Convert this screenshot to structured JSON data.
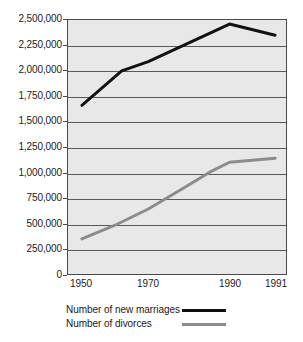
{
  "chart_data": {
    "type": "line",
    "title": "",
    "xlabel": "",
    "ylabel": "",
    "x": [
      "1950",
      "1970",
      "1990",
      "1991"
    ],
    "x_positions_px": [
      81,
      148,
      230,
      276
    ],
    "ylim": [
      0,
      2500000
    ],
    "y_ticks": [
      0,
      250000,
      500000,
      750000,
      1000000,
      1250000,
      1500000,
      1750000,
      2000000,
      2250000,
      2500000
    ],
    "y_tick_labels": [
      "0",
      "250,000",
      "500,000",
      "750,000",
      "1,000,000",
      "1,250,000",
      "1,500,000",
      "1,750,000",
      "2,000,000",
      "2,250,000",
      "2,500,000"
    ],
    "grid": true,
    "grid_orientation": "horizontal",
    "legend_position": "bottom-left",
    "series": [
      {
        "name": "Number of new marriages",
        "color": "#111111",
        "width": 3,
        "values": [
          1660000,
          2090000,
          2460000,
          2350000
        ],
        "vertices": [
          {
            "x": "1950",
            "y": 1660000
          },
          {
            "x": "1962",
            "y": 2000000
          },
          {
            "x": "1970",
            "y": 2090000
          },
          {
            "x": "1990",
            "y": 2460000
          },
          {
            "x": "1991",
            "y": 2350000
          }
        ]
      },
      {
        "name": "Number of divorces",
        "color": "#8c8c8c",
        "width": 3,
        "values": [
          345000,
          640000,
          1100000,
          1140000
        ],
        "vertices": [
          {
            "x": "1950",
            "y": 345000
          },
          {
            "x": "1960",
            "y": 480000
          },
          {
            "x": "1970",
            "y": 640000
          },
          {
            "x": "1978",
            "y": 830000
          },
          {
            "x": "1985",
            "y": 1000000
          },
          {
            "x": "1990",
            "y": 1100000
          },
          {
            "x": "1991",
            "y": 1140000
          }
        ]
      }
    ]
  },
  "axes": {
    "y_tick_labels": [
      "2,500,000",
      "2,250,000",
      "2,000,000",
      "1,750,000",
      "1,500,000",
      "1,250,000",
      "1,000,000",
      "750,000",
      "500,000",
      "250,000",
      "0"
    ],
    "x_tick_labels": [
      "1950",
      "1970",
      "1990",
      "1991"
    ]
  },
  "legend": {
    "items": [
      {
        "label": "Number of new marriages",
        "color": "#111111"
      },
      {
        "label": "Number of divorces",
        "color": "#8c8c8c"
      }
    ]
  },
  "title_remnant": "",
  "colors": {
    "plot_background": "#e8e8e8",
    "frame": "#4a4a4a",
    "gridline": "#585858",
    "marriages": "#111111",
    "divorces": "#8c8c8c",
    "page_background": "#ffffff",
    "text": "#1a1a1a"
  }
}
